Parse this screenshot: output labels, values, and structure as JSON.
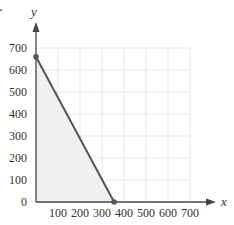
{
  "chart_data": {
    "type": "line",
    "title": "",
    "xlabel": "x",
    "ylabel": "y",
    "xlim": [
      0,
      700
    ],
    "ylim": [
      0,
      700
    ],
    "grid": true,
    "x_ticks": [
      100,
      200,
      300,
      400,
      500,
      600,
      700
    ],
    "y_ticks": [
      0,
      100,
      200,
      300,
      400,
      500,
      600,
      700
    ],
    "x_tick_labels": [
      "100",
      "200",
      "300",
      "400",
      "500",
      "600",
      "700"
    ],
    "y_tick_labels": [
      "0",
      "100",
      "200",
      "300",
      "400",
      "500",
      "600",
      "700"
    ],
    "series": [
      {
        "name": "boundary line",
        "x": [
          0,
          355
        ],
        "y": [
          660,
          0
        ],
        "markers": true,
        "color": "#555555"
      }
    ],
    "shaded_region": {
      "description": "feasible region below the line in the first quadrant",
      "vertices": [
        [
          0,
          0
        ],
        [
          0,
          660
        ],
        [
          355,
          0
        ]
      ],
      "color": "#f0f0f0"
    },
    "colors": {
      "line": "#555555",
      "axis": "#444444",
      "grid": "#e6e6e6",
      "fill": "#f0f0f0"
    }
  }
}
